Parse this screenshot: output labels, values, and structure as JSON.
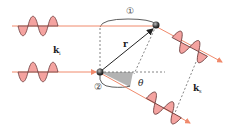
{
  "labels": {
    "incident_wavevector": "k",
    "incident_sub": "i",
    "scattered_wavevector": "k",
    "scattered_sub": "s",
    "position_vector": "r",
    "angle": "θ",
    "scatterer_1": "①",
    "scatterer_2": "②"
  },
  "colors": {
    "beam": "#f08a6c",
    "wave_fill": "#f4a3a0",
    "wave_stroke": "#6b3a3a",
    "dashed": "#666666",
    "vector": "#222222",
    "scatterer": "#333333",
    "angle_fill": "#9a9a9a"
  }
}
